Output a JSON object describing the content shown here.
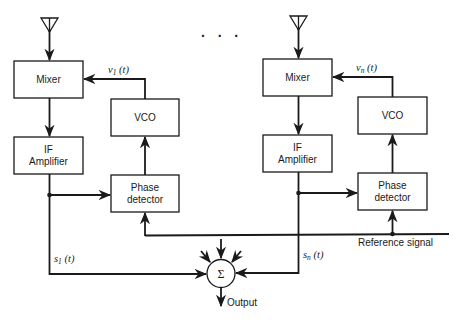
{
  "colors": {
    "ink": "#1a1a1a",
    "background": "#ffffff"
  },
  "ellipsis": "· · ·",
  "branches": [
    {
      "id": "branch-1",
      "antenna_icon": "antenna-icon",
      "mixer": "Mixer",
      "vco": "VCO",
      "if_amp_line1": "IF",
      "if_amp_line2": "Amplifier",
      "phase_det_line1": "Phase",
      "phase_det_line2": "detector",
      "lo_signal": {
        "sym": "v",
        "sub": "1",
        "arg": " (t)"
      },
      "out_signal": {
        "sym": "s",
        "sub": "1",
        "arg": " (t)"
      }
    },
    {
      "id": "branch-n",
      "antenna_icon": "antenna-icon",
      "mixer": "Mixer",
      "vco": "VCO",
      "if_amp_line1": "IF",
      "if_amp_line2": "Amplifier",
      "phase_det_line1": "Phase",
      "phase_det_line2": "detector",
      "lo_signal": {
        "sym": "v",
        "sub": "n",
        "arg": " (t)"
      },
      "out_signal": {
        "sym": "s",
        "sub": "n",
        "arg": " (t)"
      }
    }
  ],
  "reference_signal": "Reference signal",
  "summer": {
    "symbol": "Σ",
    "output": "Output"
  }
}
